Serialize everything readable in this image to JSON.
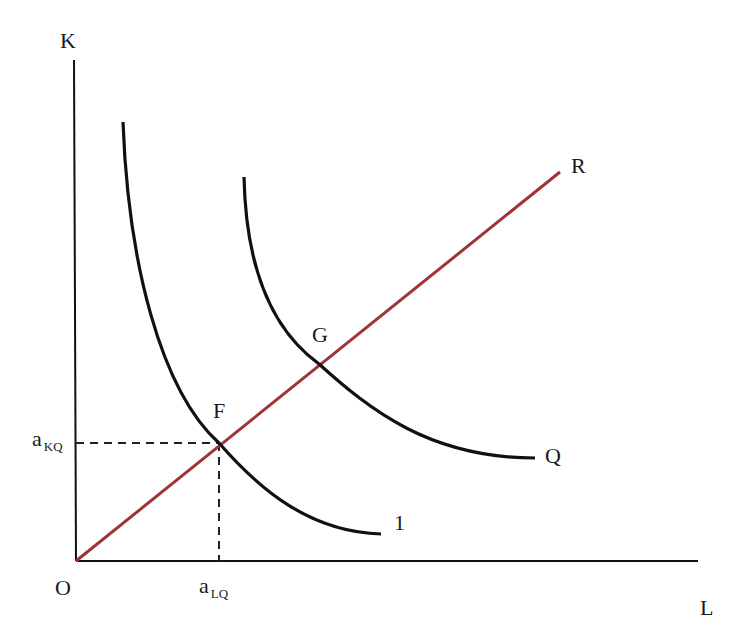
{
  "diagram": {
    "type": "isoquant",
    "axes": {
      "y_label": "K",
      "x_label": "L",
      "origin_label": "O"
    },
    "curves": [
      {
        "id": "isoquant-1",
        "label": "1",
        "color": "#111111"
      },
      {
        "id": "isoquant-Q",
        "label": "Q",
        "color": "#111111"
      }
    ],
    "ray": {
      "label": "R",
      "color": "#9e3437"
    },
    "points": [
      {
        "label": "F"
      },
      {
        "label": "G"
      }
    ],
    "ticks": {
      "y": {
        "main": "a",
        "sub": "KQ"
      },
      "x": {
        "main": "a",
        "sub": "LQ"
      }
    },
    "colors": {
      "axis": "#111111",
      "ray": "#9e3437",
      "curve": "#111111",
      "dashed": "#222222"
    }
  }
}
